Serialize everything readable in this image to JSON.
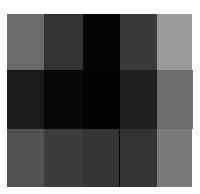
{
  "chart_data": {
    "type": "heatmap",
    "title": "",
    "xlabel": "",
    "ylabel": "",
    "rows": 3,
    "cols": 5,
    "colormap": "grayscale",
    "values": [
      [
        106,
        51,
        5,
        58,
        154
      ],
      [
        26,
        8,
        3,
        32,
        110
      ],
      [
        80,
        60,
        53,
        51,
        122
      ]
    ],
    "colors": [
      [
        "#6a6a6a",
        "#333333",
        "#050505",
        "#3a3a3a",
        "#9a9a9a"
      ],
      [
        "#1a1a1a",
        "#080808",
        "#030303",
        "#202020",
        "#6e6e6e"
      ],
      [
        "#505050",
        "#3c3c3c",
        "#353535",
        "#333333",
        "#7a7a7a"
      ]
    ],
    "grid": false,
    "legend": null
  },
  "layout": {
    "col_edges": [
      7,
      44,
      83,
      120,
      157,
      192
    ],
    "row_edges": [
      14,
      70,
      129,
      187
    ]
  }
}
